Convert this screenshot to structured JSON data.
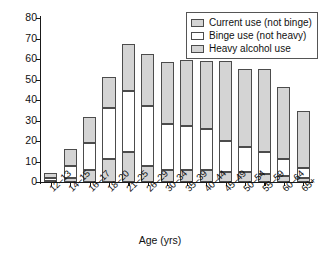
{
  "chart_data": {
    "type": "bar",
    "subtype": "stacked-bar",
    "title": "",
    "xlabel": "Age (yrs)",
    "ylabel": "Percent using in past month",
    "ylim": [
      0,
      80
    ],
    "yticks": [
      0,
      10,
      20,
      30,
      40,
      50,
      60,
      70,
      80
    ],
    "grid": false,
    "legend_position": "top-right",
    "categories": [
      "12–13",
      "14–15",
      "16–17",
      "18–20",
      "21–25",
      "26–29",
      "30–34",
      "35–39",
      "40–44",
      "45–49",
      "50–54",
      "55–59",
      "60–64",
      "65+"
    ],
    "series": [
      {
        "name": "Heavy alcohol use",
        "color": "#d4d4d4",
        "values": [
          0.6,
          2.1,
          6.0,
          11.0,
          14.5,
          8.0,
          6.0,
          6.0,
          6.0,
          5.0,
          5.0,
          4.0,
          3.0,
          1.8
        ]
      },
      {
        "name": "Binge use (not heavy)",
        "color": "#ffffff",
        "values": [
          1.2,
          5.9,
          13.0,
          25.0,
          30.0,
          29.0,
          22.5,
          21.5,
          20.0,
          15.0,
          12.0,
          10.5,
          8.0,
          5.2
        ]
      },
      {
        "name": "Current use (not binge)",
        "color": "#d4d4d4",
        "values": [
          2.7,
          8.0,
          12.5,
          15.0,
          23.0,
          25.5,
          30.0,
          32.0,
          33.0,
          39.0,
          38.0,
          40.5,
          35.5,
          27.5
        ]
      }
    ],
    "totals": [
      4.5,
      16.0,
      31.5,
      51.0,
      67.5,
      62.5,
      58.5,
      59.5,
      59.0,
      59.0,
      55.0,
      55.0,
      46.5,
      34.5
    ]
  },
  "legend": {
    "items": [
      {
        "label": "Current use (not binge)",
        "swatch": "#d4d4d4"
      },
      {
        "label": "Binge use (not heavy)",
        "swatch": "#ffffff"
      },
      {
        "label": "Heavy alcohol use",
        "swatch": "#d4d4d4"
      }
    ]
  },
  "axes": {
    "y_title": "Percent using in past month",
    "x_title": "Age (yrs)"
  }
}
